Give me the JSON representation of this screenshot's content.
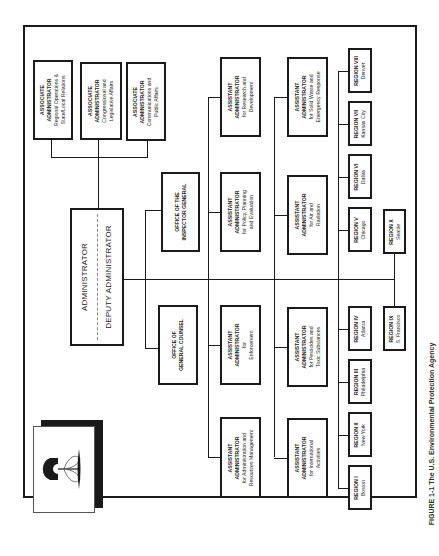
{
  "orientation": "rotated 90 degrees counter-clockwise",
  "top": {
    "administrator": "ADMINISTRATOR",
    "deputy": "DEPUTY ADMINISTRATOR"
  },
  "associates": [
    {
      "title": "ASSOCIATE",
      "title2": "ADMINISTRATOR",
      "l1": "Regional Operations &",
      "l2": "State/Local Relations"
    },
    {
      "title": "ASSOCIATE",
      "title2": "ADMINISTRATOR",
      "l1": "Congressional and",
      "l2": "Legislative Affairs"
    },
    {
      "title": "ASSOCIATE",
      "title2": "ADMINISTRATOR",
      "l1": "Communications and",
      "l2": "Public Affairs"
    }
  ],
  "offices": {
    "inspector_general": {
      "l1": "OFFICE OF THE",
      "l2": "INSPECTOR GENERAL"
    },
    "general_counsel": {
      "l1": "OFFICE OF",
      "l2": "GENERAL COUNSEL"
    }
  },
  "assistants": [
    {
      "title": "ASSISTANT",
      "title2": "ADMINISTRATOR",
      "l1": "for Research and",
      "l2": "Development"
    },
    {
      "title": "ASSISTANT",
      "title2": "ADMINISTRATOR",
      "l1": "for Policy, Planning",
      "l2": "and Evaluation"
    },
    {
      "title": "ASSISTANT",
      "title2": "ADMINISTRATOR",
      "l1": "for",
      "l2": "Enforcement"
    },
    {
      "title": "ASSISTANT",
      "title2": "ADMINISTRATOR",
      "l1": "for Administration and",
      "l2": "Resources Management"
    },
    {
      "title": "ASSISTANT",
      "title2": "ADMINISTRATOR",
      "l1": "for Solid Waste and",
      "l2": "Emergency Response"
    },
    {
      "title": "ASSISTANT",
      "title2": "ADMINISTRATOR",
      "l1": "for Air and",
      "l2": "Radiation"
    },
    {
      "title": "ASSISTANT",
      "title2": "ADMINISTRATOR",
      "l1": "for Pesticides and",
      "l2": "Toxic Substances"
    },
    {
      "title": "ASSISTANT",
      "title2": "ADMINISTRATOR",
      "l1": "for International",
      "l2": "Activities"
    }
  ],
  "regions": [
    {
      "name": "REGION VIII",
      "city": "Denver"
    },
    {
      "name": "REGION VII",
      "city": "Kansas City"
    },
    {
      "name": "REGION VI",
      "city": "Dallas"
    },
    {
      "name": "REGION V",
      "city": "Chicago"
    },
    {
      "name": "REGION IV",
      "city": "Atlanta"
    },
    {
      "name": "REGION III",
      "city": "Philadelphia"
    },
    {
      "name": "REGION II",
      "city": "New York"
    },
    {
      "name": "REGION I",
      "city": "Boston"
    },
    {
      "name": "REGION X",
      "city": "Seattle"
    },
    {
      "name": "REGION IX",
      "city": "S. Francisco"
    }
  ],
  "caption": "FIGURE 1-1  The U.S. Environmental Protection Agency"
}
